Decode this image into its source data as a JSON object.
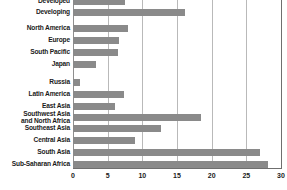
{
  "chart_data": {
    "type": "bar",
    "orientation": "horizontal",
    "title": "",
    "subtitle": "",
    "xlabel": "",
    "ylabel": "",
    "xlim": [
      0,
      30
    ],
    "xticks": [
      "0",
      "5",
      "10",
      "15",
      "20",
      "25",
      "30"
    ],
    "xtick_values": [
      0,
      5,
      10,
      15,
      20,
      25,
      30
    ],
    "grid": true,
    "legend": "none",
    "bar_color": "#8a8a8a",
    "background_color": "#ffffff",
    "axis_color": "#6f6f6f",
    "gridline_color": "#b9b9b9",
    "label_color": "#1b1b1b",
    "note": "Top category 'Developed' is clipped by the top edge of the screenshot.",
    "categories": [
      "Developed",
      "Developing",
      "North America",
      "Europe",
      "South Pacific",
      "Japan",
      "Russia",
      "Latin America",
      "East Asia",
      "Southwest Asia\nand North Africa",
      "Southeast Asia",
      "Central Asia",
      "South Asia",
      "Sub-Saharan Africa"
    ],
    "values": [
      7.5,
      16.2,
      8.0,
      6.6,
      6.5,
      3.3,
      1.0,
      7.4,
      6.0,
      18.4,
      12.7,
      9.0,
      27.0,
      28.1
    ],
    "bars": [
      {
        "label": "Developed",
        "value": 7.5,
        "top": -3,
        "clipped": true
      },
      {
        "label": "Developing",
        "value": 16.2,
        "top": 8,
        "clipped": false
      },
      {
        "label": "North America",
        "value": 8.0,
        "top": 24,
        "clipped": false
      },
      {
        "label": "Europe",
        "value": 6.6,
        "top": 36,
        "clipped": false
      },
      {
        "label": "South Pacific",
        "value": 6.5,
        "top": 48,
        "clipped": false
      },
      {
        "label": "Japan",
        "value": 3.3,
        "top": 60,
        "clipped": false
      },
      {
        "label": "Russia",
        "value": 1.0,
        "top": 78,
        "clipped": false
      },
      {
        "label": "Latin America",
        "value": 7.4,
        "top": 90,
        "clipped": false
      },
      {
        "label": "East Asia",
        "value": 6.0,
        "top": 102,
        "clipped": false
      },
      {
        "label": "Southwest Asia\nand North Africa",
        "value": 18.4,
        "top": 113,
        "clipped": false
      },
      {
        "label": "Southeast Asia",
        "value": 12.7,
        "top": 124,
        "clipped": false
      },
      {
        "label": "Central Asia",
        "value": 9.0,
        "top": 136,
        "clipped": false
      },
      {
        "label": "South Asia",
        "value": 27.0,
        "top": 148,
        "clipped": false
      },
      {
        "label": "Sub-Saharan Africa",
        "value": 28.1,
        "top": 160,
        "clipped": false
      }
    ]
  }
}
